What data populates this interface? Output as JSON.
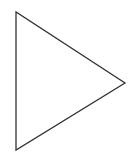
{
  "diagram": {
    "shape": "triangle",
    "orientation": "pointing-right",
    "vertices": [
      [
        16,
        12
      ],
      [
        16,
        150
      ],
      [
        125,
        83
      ]
    ],
    "stroke_color": "#333333",
    "fill_color": "#ffffff",
    "stroke_width": 1.3
  }
}
